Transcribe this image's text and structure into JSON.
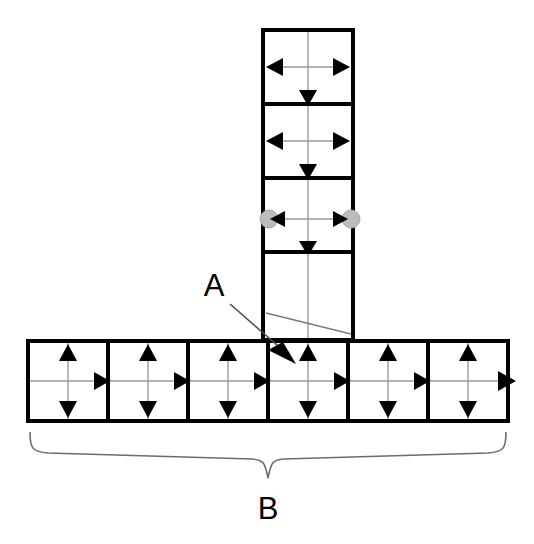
{
  "diagram": {
    "type": "technical-line-drawing",
    "background_color": "#ffffff",
    "stroke_color": "#000000",
    "axis_color": "#9a9a9a",
    "node_color": "#bcbcbc",
    "canvas": {
      "width": 534,
      "height": 544
    },
    "callouts": [
      {
        "id": "callout-a",
        "label": "A",
        "text_x": 214,
        "text_y": 296,
        "leader": {
          "x1": 228,
          "y1": 303,
          "x2": 291,
          "y2": 356
        },
        "target_arrow": {
          "x": 291,
          "y": 356,
          "angle": 42
        }
      },
      {
        "id": "callout-b",
        "label": "B",
        "text_x": 267,
        "text_y": 518,
        "brace": {
          "left": 30,
          "right": 506,
          "top": 432,
          "tip_x": 268,
          "depth": 28
        }
      }
    ],
    "column": {
      "name": "vertical-column",
      "x": 263,
      "y": 30,
      "width": 90,
      "height": 310,
      "cells": [
        {
          "index": 0,
          "y": 30,
          "height": 74,
          "arrows": [
            "left",
            "right",
            "down"
          ],
          "nodes": []
        },
        {
          "index": 1,
          "y": 104,
          "height": 74,
          "arrows": [
            "left",
            "right",
            "down"
          ],
          "nodes": []
        },
        {
          "index": 2,
          "y": 178,
          "height": 74,
          "arrows": [
            "left",
            "right",
            "down"
          ],
          "nodes": [
            "left",
            "right",
            "bottom"
          ]
        },
        {
          "index": 3,
          "y": 252,
          "height": 88,
          "arrows": [],
          "nodes": [],
          "diagonal": true
        }
      ]
    },
    "row": {
      "name": "horizontal-row",
      "x": 28,
      "y": 341,
      "width": 480,
      "height": 80,
      "cell_count": 6,
      "cells": [
        {
          "index": 0,
          "arrows": [
            "up",
            "down",
            "right"
          ]
        },
        {
          "index": 1,
          "arrows": [
            "up",
            "down",
            "right"
          ]
        },
        {
          "index": 2,
          "arrows": [
            "up",
            "down",
            "right"
          ]
        },
        {
          "index": 3,
          "arrows": [
            "up",
            "down",
            "right"
          ]
        },
        {
          "index": 4,
          "arrows": [
            "up",
            "down",
            "right"
          ]
        },
        {
          "index": 5,
          "arrows": [
            "up",
            "down",
            "right"
          ]
        }
      ]
    }
  }
}
